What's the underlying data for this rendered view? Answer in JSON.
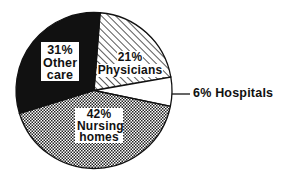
{
  "chart_data": {
    "type": "pie",
    "title": "",
    "categories": [
      "Physicians",
      "Hospitals",
      "Nursing homes",
      "Other care"
    ],
    "values": [
      21,
      6,
      42,
      31
    ],
    "unit": "%",
    "labels": [
      {
        "pct": "21%",
        "name": "Physicians",
        "fill": "diagonal-hatch",
        "position": "inside"
      },
      {
        "pct": "6%",
        "name": "Hospitals",
        "fill": "white",
        "position": "outside-right-leader-line"
      },
      {
        "pct": "42%",
        "name_line1": "Nursing",
        "name_line2": "homes",
        "fill": "dotted-stipple",
        "position": "inside"
      },
      {
        "pct": "31%",
        "name_line1": "Other",
        "name_line2": "care",
        "fill": "black",
        "position": "inside"
      }
    ],
    "legend": "none",
    "grid": false
  },
  "labels": {
    "physicians_pct": "21%",
    "physicians_name": "Physicians",
    "hospitals_text": "6% Hospitals",
    "nursing_pct": "42%",
    "nursing_name1": "Nursing",
    "nursing_name2": "homes",
    "other_pct": "31%",
    "other_name1": "Other",
    "other_name2": "care"
  },
  "colors": {
    "ink": "#111111",
    "background": "#ffffff"
  }
}
